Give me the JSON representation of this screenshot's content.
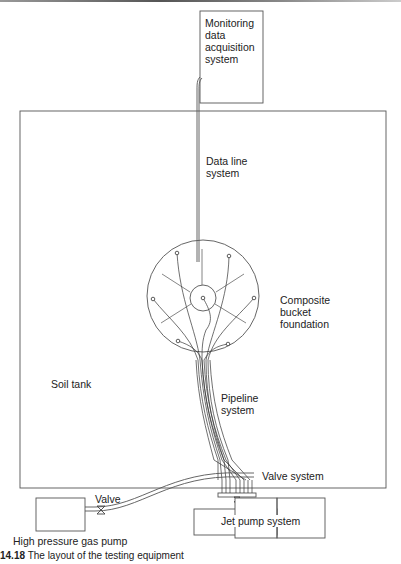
{
  "figure": {
    "caption_prefix": "14.18",
    "caption_text": "The layout of the testing equipment"
  },
  "labels": {
    "monitoring": [
      "Monitoring",
      "data",
      "acquisition",
      "system"
    ],
    "data_line": [
      "Data line",
      "system"
    ],
    "composite": [
      "Composite",
      "bucket",
      "foundation"
    ],
    "soil_tank": "Soil tank",
    "pipeline": [
      "Pipeline",
      "system"
    ],
    "valve_system": "Valve system",
    "valve": "Valve",
    "gas_pump": "High pressure gas pump",
    "jet_pump": "Jet pump system"
  },
  "colors": {
    "line": "#555555",
    "text": "#222222",
    "background": "#ffffff"
  }
}
